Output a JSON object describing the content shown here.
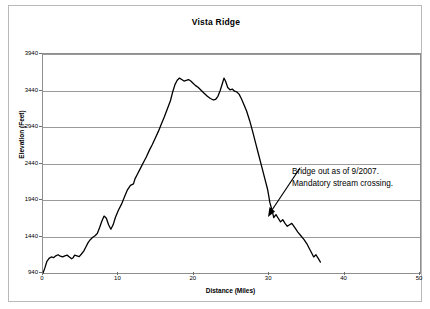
{
  "chart_data": {
    "type": "line",
    "title": "Vista Ridge",
    "xlabel": "Distance (Miles)",
    "ylabel": "Elevation (Feet)",
    "xlim": [
      0,
      50
    ],
    "ylim": [
      940,
      3940
    ],
    "xticks": [
      0,
      10,
      20,
      30,
      40,
      50
    ],
    "xtick_labels": [
      "0",
      "10",
      "20",
      "30",
      "40",
      "50"
    ],
    "yticks": [
      940,
      1440,
      1940,
      2440,
      2940,
      3440,
      3940
    ],
    "ytick_labels": [
      "940",
      "1440",
      "1940",
      "2440",
      "2940",
      "3440",
      "3940"
    ],
    "grid": "horizontal",
    "legend": "none",
    "series_name": "Elevation profile",
    "line_color": "#000000",
    "x": [
      0.0,
      0.25,
      0.5,
      0.8,
      1.1,
      1.4,
      1.7,
      2.0,
      2.3,
      2.6,
      2.9,
      3.2,
      3.5,
      3.8,
      4.0,
      4.2,
      4.5,
      4.8,
      5.1,
      5.4,
      5.7,
      6.0,
      6.3,
      6.6,
      6.9,
      7.2,
      7.5,
      7.8,
      8.1,
      8.4,
      8.7,
      9.0,
      9.3,
      9.6,
      10.0,
      10.4,
      10.8,
      11.2,
      11.6,
      12.0,
      12.2,
      12.5,
      12.9,
      13.3,
      13.7,
      14.1,
      14.5,
      14.9,
      15.3,
      15.7,
      16.1,
      16.5,
      16.9,
      17.2,
      17.5,
      17.8,
      18.1,
      18.4,
      18.7,
      19.0,
      19.3,
      19.6,
      19.9,
      20.2,
      20.6,
      21.0,
      21.4,
      21.8,
      22.2,
      22.6,
      22.9,
      23.2,
      23.5,
      23.8,
      24.0,
      24.2,
      24.5,
      24.8,
      25.1,
      25.4,
      25.7,
      26.0,
      26.3,
      26.6,
      27.0,
      27.4,
      27.8,
      28.2,
      28.6,
      29.0,
      29.4,
      29.8,
      30.1,
      30.4,
      30.6,
      30.9,
      31.2,
      31.5,
      31.8,
      32.1,
      32.4,
      32.7,
      33.0,
      33.4,
      33.8,
      34.2,
      34.6,
      35.0,
      35.3,
      35.6,
      35.9,
      36.2,
      36.5,
      36.8
    ],
    "y": [
      940,
      1010,
      1095,
      1140,
      1160,
      1150,
      1175,
      1190,
      1170,
      1160,
      1175,
      1185,
      1160,
      1135,
      1150,
      1185,
      1175,
      1165,
      1200,
      1240,
      1300,
      1360,
      1400,
      1430,
      1450,
      1480,
      1560,
      1650,
      1720,
      1690,
      1600,
      1540,
      1600,
      1700,
      1800,
      1880,
      1980,
      2080,
      2140,
      2160,
      2230,
      2290,
      2370,
      2450,
      2530,
      2620,
      2700,
      2790,
      2880,
      2980,
      3080,
      3190,
      3300,
      3420,
      3520,
      3580,
      3610,
      3590,
      3570,
      3580,
      3590,
      3570,
      3540,
      3510,
      3480,
      3440,
      3400,
      3360,
      3330,
      3310,
      3320,
      3360,
      3440,
      3540,
      3610,
      3570,
      3480,
      3450,
      3460,
      3430,
      3420,
      3390,
      3330,
      3260,
      3160,
      3030,
      2880,
      2720,
      2560,
      2400,
      2240,
      2080,
      1900,
      1790,
      1700,
      1740,
      1690,
      1640,
      1670,
      1620,
      1580,
      1600,
      1620,
      1560,
      1500,
      1450,
      1400,
      1340,
      1280,
      1220,
      1160,
      1190,
      1140,
      1090,
      1030,
      970,
      945
    ]
  },
  "annotation": {
    "line1": "Bridge out as of 9/2007.",
    "line2": "Mandatory stream crossing.",
    "arrow_name": "annotation-arrow"
  }
}
